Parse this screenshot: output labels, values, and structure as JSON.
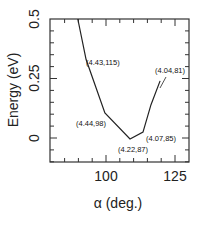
{
  "chart_data": {
    "type": "line",
    "title": "",
    "xlabel": "α (deg.)",
    "ylabel": "Energy (eV)",
    "xlim": [
      80,
      130
    ],
    "ylim": [
      -0.1,
      0.5
    ],
    "x_ticks": [
      100,
      125
    ],
    "x_tick_labels": [
      "100",
      "125"
    ],
    "x_minor_step": 5,
    "y_ticks": [
      0,
      0.25,
      0.5
    ],
    "y_tick_labels": [
      "0",
      "0.25",
      "0.5"
    ],
    "y_minor_step": 0.05,
    "grid": false,
    "legend": null,
    "series": [
      {
        "name": "Energy",
        "x": [
          89.8,
          92.8,
          99.6,
          108.7,
          113.4,
          116.3,
          119.6
        ],
        "y": [
          0.5,
          0.33,
          0.105,
          -0.004,
          0.025,
          0.14,
          0.24
        ]
      }
    ],
    "annotations": [
      {
        "text": "(4.43,115)",
        "x": 93.3,
        "y": 0.34
      },
      {
        "text": "(4.44,98)",
        "x": 84.5,
        "y": 0.085
      },
      {
        "text": "(4.22,87)",
        "x": 102.5,
        "y": -0.04
      },
      {
        "text": "(4.07,85)",
        "x": 113.5,
        "y": 0.0
      },
      {
        "text": "(4.04,81)",
        "x": 117.5,
        "y": 0.285
      }
    ]
  },
  "labels": {
    "xlabel": "α (deg.)",
    "ylabel": "Energy (eV)",
    "xtick_100": "100",
    "xtick_125": "125",
    "ytick_0": "0",
    "ytick_025": "0.25",
    "ytick_05": "0.5",
    "ann_1": "(4.43,115)",
    "ann_2": "(4.44,98)",
    "ann_3": "(4.22,87)",
    "ann_4": "(4.07,85)",
    "ann_5": "(4.04,81)"
  }
}
